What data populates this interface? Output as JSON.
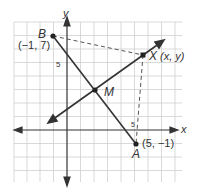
{
  "figure": {
    "axes": {
      "x_label": "x",
      "y_label": "y",
      "tick_label_y": "5",
      "tick_label_x": "5"
    },
    "points": {
      "B": {
        "name": "B",
        "coords": "(−1, 7)"
      },
      "A": {
        "name": "A",
        "coords": "(5, −1)"
      },
      "M": {
        "name": "M"
      },
      "X": {
        "name": "X",
        "coords": "(x, y)"
      }
    },
    "colors": {
      "grid": "#c8c8c8",
      "line": "#333333",
      "dash": "#555555"
    }
  }
}
